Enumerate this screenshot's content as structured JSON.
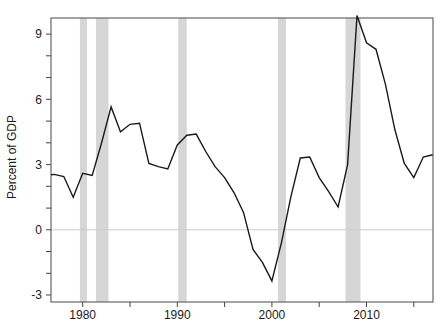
{
  "chart_data": {
    "type": "line",
    "title": "",
    "xlabel": "",
    "ylabel": "Percent of GDP",
    "grid": false,
    "legend": null,
    "xlim": [
      1976.65,
      2017.03
    ],
    "ylim": [
      -3.32,
      9.74
    ],
    "x_ticks_labeled": [
      1980,
      1990,
      2000,
      2010
    ],
    "x_tick_labels": [
      "1980",
      "1990",
      "2000",
      "2010"
    ],
    "x_ticks_minor": [
      1985,
      1995,
      2005,
      2015
    ],
    "y_ticks_labeled": [
      -3,
      0,
      3,
      6,
      9
    ],
    "y_tick_labels": [
      "-3",
      "0",
      "3",
      "6",
      "9"
    ],
    "y_ticks_minor": [
      -2,
      -1,
      1,
      2,
      4,
      5,
      7,
      8
    ],
    "zero_line_y": 0,
    "x": [
      1976,
      1977,
      1978,
      1979,
      1980,
      1981,
      1982,
      1983,
      1984,
      1985,
      1986,
      1987,
      1988,
      1989,
      1990,
      1991,
      1992,
      1993,
      1994,
      1995,
      1996,
      1997,
      1998,
      1999,
      2000,
      2001,
      2002,
      2003,
      2004,
      2005,
      2006,
      2007,
      2008,
      2009,
      2010,
      2011,
      2012,
      2013,
      2014,
      2015,
      2016,
      2017
    ],
    "values": [
      2.5,
      2.55,
      2.45,
      1.5,
      2.6,
      2.5,
      4.0,
      5.65,
      4.5,
      4.85,
      4.9,
      3.05,
      2.9,
      2.8,
      3.9,
      4.35,
      4.4,
      3.6,
      2.9,
      2.4,
      1.7,
      0.8,
      -0.9,
      -1.5,
      -2.35,
      -0.6,
      1.5,
      3.3,
      3.35,
      2.4,
      1.75,
      1.05,
      3.0,
      9.85,
      8.6,
      8.3,
      6.7,
      4.6,
      3.05,
      2.4,
      3.35,
      3.45
    ],
    "recession_bands": [
      [
        1979.7,
        1980.45
      ],
      [
        1981.4,
        1982.73
      ],
      [
        1990.1,
        1991.0
      ],
      [
        2000.65,
        2001.5
      ],
      [
        2007.78,
        2009.37
      ]
    ],
    "colors": {
      "line": "#1a1a1a",
      "band": "#d6d6d6",
      "zero_line": "#cccccc",
      "frame": "#666666",
      "tick": "#444444",
      "text": "#1a1a1a"
    }
  }
}
